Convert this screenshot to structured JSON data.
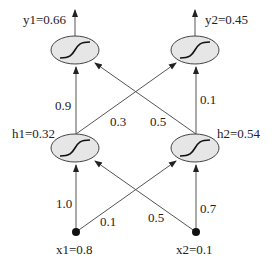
{
  "diagram": {
    "type": "neural-network",
    "nodes": {
      "y1": {
        "label": "y1=0.66",
        "cx": 75,
        "cy": 50,
        "kind": "sigmoid"
      },
      "y2": {
        "label": "y2=0.45",
        "cx": 195,
        "cy": 50,
        "kind": "sigmoid"
      },
      "h1": {
        "label": "h1=0.32",
        "cx": 75,
        "cy": 148,
        "kind": "sigmoid"
      },
      "h2": {
        "label": "h2=0.54",
        "cx": 195,
        "cy": 148,
        "kind": "sigmoid"
      },
      "x1": {
        "label": "x1=0.8",
        "cx": 76,
        "cy": 232,
        "kind": "input"
      },
      "x2": {
        "label": "x2=0.1",
        "cx": 196,
        "cy": 232,
        "kind": "input"
      }
    },
    "edges": [
      {
        "from": "x1",
        "to": "h1",
        "weight": "1.0"
      },
      {
        "from": "x1",
        "to": "h2",
        "weight": "0.1"
      },
      {
        "from": "x2",
        "to": "h1",
        "weight": "0.5"
      },
      {
        "from": "x2",
        "to": "h2",
        "weight": "0.7"
      },
      {
        "from": "h1",
        "to": "y1",
        "weight": "0.9"
      },
      {
        "from": "h1",
        "to": "y2",
        "weight": "0.3"
      },
      {
        "from": "h2",
        "to": "y1",
        "weight": "0.5"
      },
      {
        "from": "h2",
        "to": "y2",
        "weight": "0.1"
      }
    ],
    "colors": {
      "node_fill": "#e6e6e6",
      "stroke": "#444444",
      "edge": "#555555"
    }
  }
}
